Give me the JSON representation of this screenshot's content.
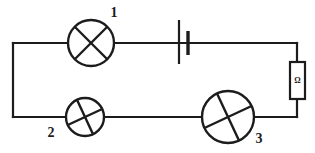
{
  "diagram": {
    "background_color": "#ffffff",
    "line_color": "#1c1c1c",
    "width": 315,
    "height": 153
  },
  "components": {
    "lamp1": {
      "label": "1",
      "kind": "lamp",
      "symbol": "circle-with-cross",
      "cx": 91,
      "cy": 43,
      "r": 23,
      "cross_rotation_deg": 0,
      "label_x": 114,
      "label_y": 17
    },
    "lamp2": {
      "label": "2",
      "kind": "lamp",
      "symbol": "circle-with-cross",
      "cx": 85,
      "cy": 117,
      "r": 19,
      "cross_rotation_deg": 20,
      "label_x": 51,
      "label_y": 137
    },
    "lamp3": {
      "label": "3",
      "kind": "lamp",
      "symbol": "circle-with-cross",
      "cx": 228,
      "cy": 117,
      "r": 26,
      "cross_rotation_deg": 20,
      "label_x": 259,
      "label_y": 143
    },
    "battery": {
      "label": "",
      "kind": "battery",
      "symbol": "cell",
      "long_plate_x": 179,
      "long_plate_y1": 20,
      "long_plate_y2": 64,
      "short_plate_x": 188,
      "short_plate_y1": 31,
      "short_plate_y2": 55
    },
    "resistor": {
      "label": "Ω",
      "kind": "resistor",
      "symbol": "rectangle-with-omega",
      "x": 290,
      "y": 62,
      "width": 15,
      "height": 37,
      "text_x": 297.5,
      "text_y": 83
    }
  },
  "wires": {
    "top_left_to_lamp1": "M 13 43 L 68 43",
    "lamp1_to_battery": "M 114 43 L 183 43",
    "battery_to_top_right": "M 183 43 L 297 43",
    "left_vertical": "M 13 43 L 13 117",
    "bottom_left_to_lamp2": "M 13 117 L 66 117",
    "lamp2_to_lamp3": "M 104 117 L 202 117",
    "lamp3_to_bottom_right": "M 254 117 L 297 117",
    "right_vertical_top": "M 297 43 L 297 62",
    "right_vertical_bottom": "M 297 99 L 297 117"
  }
}
